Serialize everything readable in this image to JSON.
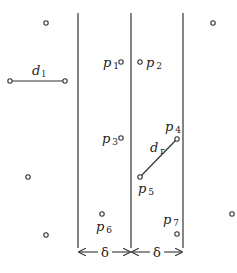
{
  "diagram": {
    "type": "geometric-strip-partition",
    "colors": {
      "stroke": "#333333",
      "point_fill": "#ffffff",
      "text": "#222222"
    },
    "boundary_lines": [
      {
        "id": "left-strip-boundary",
        "x": 78,
        "y1": 13,
        "y2": 248
      },
      {
        "id": "dividing-line",
        "x": 131,
        "y1": 13,
        "y2": 248
      },
      {
        "id": "right-strip-boundary",
        "x": 183,
        "y1": 13,
        "y2": 248
      }
    ],
    "points": [
      {
        "id": "top-left-point",
        "x": 46,
        "y": 23,
        "label": null
      },
      {
        "id": "top-right-point",
        "x": 213,
        "y": 23,
        "label": null
      },
      {
        "id": "dl-endpoint-left",
        "x": 10,
        "y": 81,
        "label": null
      },
      {
        "id": "dl-endpoint-right",
        "x": 65,
        "y": 81,
        "label": null
      },
      {
        "id": "p1",
        "x": 121,
        "y": 62,
        "label": "p",
        "sub": "1",
        "lx": 103,
        "ly": 67
      },
      {
        "id": "p2",
        "x": 140,
        "y": 62,
        "label": "p",
        "sub": "2",
        "lx": 146,
        "ly": 67
      },
      {
        "id": "p3",
        "x": 121,
        "y": 138,
        "label": "p",
        "sub": "3",
        "lx": 102,
        "ly": 143
      },
      {
        "id": "p4",
        "x": 177,
        "y": 139,
        "label": "p",
        "sub": "4",
        "lx": 165,
        "ly": 131
      },
      {
        "id": "p5",
        "x": 140,
        "y": 177,
        "label": "p",
        "sub": "5",
        "lx": 138,
        "ly": 193
      },
      {
        "id": "p6",
        "x": 102,
        "y": 214,
        "label": "p",
        "sub": "6",
        "lx": 96,
        "ly": 231
      },
      {
        "id": "p7",
        "x": 177,
        "y": 234,
        "label": "p",
        "sub": "7",
        "lx": 163,
        "ly": 224
      },
      {
        "id": "mid-left-point",
        "x": 28,
        "y": 177,
        "label": null
      },
      {
        "id": "bottom-left-point",
        "x": 46,
        "y": 235,
        "label": null
      },
      {
        "id": "bottom-right-point",
        "x": 232,
        "y": 214,
        "label": null
      }
    ],
    "segments": [
      {
        "id": "dl-segment",
        "x1": 10,
        "y1": 81,
        "x2": 65,
        "y2": 81,
        "label": "d",
        "sub": "l",
        "lx": 32,
        "ly": 75
      },
      {
        "id": "dr-segment",
        "x1": 140,
        "y1": 177,
        "x2": 177,
        "y2": 139,
        "label": "d",
        "sub": "r",
        "lx": 150,
        "ly": 152
      }
    ],
    "width_markers": [
      {
        "id": "left-delta",
        "label": "δ",
        "x1": 78,
        "x2": 131,
        "y": 252,
        "lx": 105
      },
      {
        "id": "right-delta",
        "label": "δ",
        "x1": 131,
        "x2": 183,
        "y": 252,
        "lx": 157
      }
    ]
  }
}
